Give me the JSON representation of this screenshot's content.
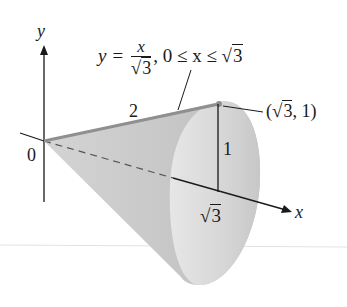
{
  "figure": {
    "type": "cone-of-revolution",
    "axes": {
      "x_label": "x",
      "y_label": "y",
      "origin_label": "0"
    },
    "curve_label": {
      "lhs": "y =",
      "numerator": "x",
      "denominator_radical": "√",
      "denominator_arg": "3",
      "domain_text": ", 0 ≤ x ≤ ",
      "domain_radical": "√",
      "domain_arg": "3"
    },
    "slant_length_label": "2",
    "height_label": "1",
    "base_distance_label": {
      "radical": "√",
      "arg": "3"
    },
    "endpoint_label": {
      "open": "(",
      "radical": "√",
      "arg": "3",
      "rest": ", 1)"
    },
    "colors": {
      "cone_fill": "#c9c9c9",
      "cone_light": "#e6e6e6",
      "ink": "#1a1a1a",
      "generator_line": "#8f8f8f"
    }
  }
}
